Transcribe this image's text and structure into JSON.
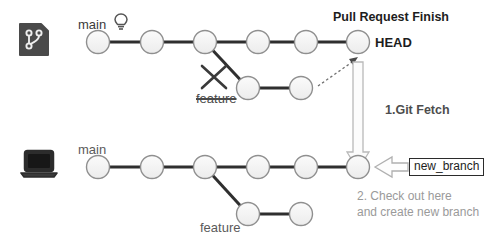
{
  "diagram": {
    "background_color": "#ffffff",
    "node_fill": "#f4f4f4",
    "node_stroke": "#9a9a9a",
    "edge_color": "#2f2f2f",
    "muted_text_color": "#9a9a9a"
  },
  "remote": {
    "icon_name": "git-repository-icon",
    "icon_color": "#4a4a4a",
    "main_branch_label": "main",
    "bulb_icon_name": "lightbulb-icon",
    "feature_branch_label": "feature",
    "feature_deleted": true,
    "pull_request_label": "Pull Request Finish",
    "head_label": "HEAD",
    "main_commits": 6,
    "feature_commits": 2
  },
  "local": {
    "icon_name": "laptop-icon",
    "icon_color": "#333333",
    "main_branch_label": "main",
    "feature_branch_label": "feature",
    "main_commits": 6,
    "feature_commits": 2,
    "new_branch_tag": "new_branch"
  },
  "annotations": {
    "step1": "1.Git Fetch",
    "step2_line1": "2. Check out here",
    "step2_line2": "and create new branch"
  }
}
